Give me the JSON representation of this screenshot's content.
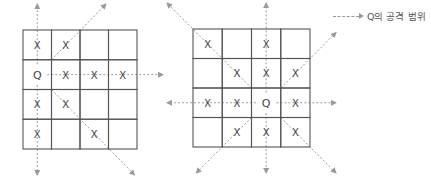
{
  "legend": {
    "label": "Q의 공격 범위",
    "icon": "dashed-arrow-icon"
  },
  "colors": {
    "grid_line": "#555555",
    "arrow": "#9a9a9a",
    "text": "#444444"
  },
  "boards": [
    {
      "name": "board-left",
      "size": 4,
      "queen": [
        1,
        0
      ],
      "cells": [
        [
          "X",
          "X",
          "",
          ""
        ],
        [
          "Q",
          "X",
          "X",
          "X"
        ],
        [
          "X",
          "X",
          "",
          ""
        ],
        [
          "X",
          "",
          "X",
          ""
        ]
      ]
    },
    {
      "name": "board-right",
      "size": 4,
      "queen": [
        2,
        2
      ],
      "cells": [
        [
          "X",
          "",
          "X",
          ""
        ],
        [
          "",
          "X",
          "X",
          "X"
        ],
        [
          "X",
          "X",
          "Q",
          "X"
        ],
        [
          "",
          "X",
          "X",
          "X"
        ]
      ]
    }
  ]
}
